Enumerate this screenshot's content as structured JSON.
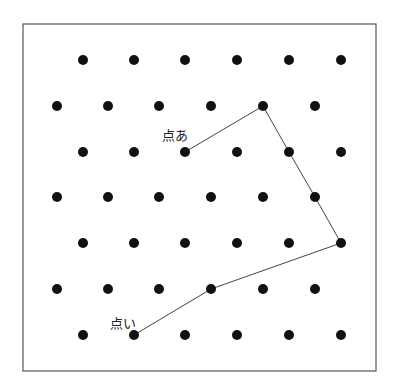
{
  "frame": {
    "x": 23,
    "y": 24,
    "width": 353,
    "height": 347,
    "stroke": "#555555"
  },
  "grid": {
    "rows_y": [
      60,
      106,
      152,
      197,
      243,
      289,
      335
    ],
    "odd_row_x": [
      83,
      134,
      185,
      237,
      289,
      341
    ],
    "even_row_x": [
      57,
      108,
      159,
      211,
      263,
      315
    ],
    "dot_radius": 5,
    "dot_color": "#111111"
  },
  "path": {
    "color": "#444444",
    "points": [
      [
        185,
        152
      ],
      [
        263,
        106
      ],
      [
        289,
        152
      ],
      [
        315,
        197
      ],
      [
        341,
        243
      ],
      [
        211,
        289
      ],
      [
        134,
        335
      ]
    ]
  },
  "labels": {
    "point_a": {
      "text": "点あ",
      "x": 162,
      "y": 140
    },
    "point_i": {
      "text": "点い",
      "x": 110,
      "y": 328
    }
  }
}
